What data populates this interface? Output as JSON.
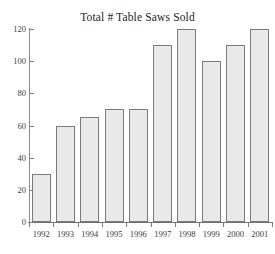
{
  "chart_data": {
    "type": "bar",
    "title": "Total # Table Saws Sold",
    "xlabel": "",
    "ylabel": "",
    "categories": [
      "1992",
      "1993",
      "1994",
      "1995",
      "1996",
      "1997",
      "1998",
      "1999",
      "2000",
      "2001"
    ],
    "values": [
      30,
      60,
      65,
      70,
      70,
      110,
      120,
      100,
      110,
      120
    ],
    "ylim": [
      0,
      120
    ],
    "yticks": [
      0,
      20,
      40,
      60,
      80,
      100,
      120
    ],
    "ytick_labels": [
      "0",
      "20",
      "40",
      "60",
      "80",
      "100",
      "120"
    ],
    "grid": false,
    "legend": null,
    "bar_fill_color": "#e9e9e9",
    "bar_border_color": "#7a7a7a",
    "axis_color": "#7d7d7d",
    "background_color": "#ffffff",
    "text_color": "#3c3c3c"
  }
}
